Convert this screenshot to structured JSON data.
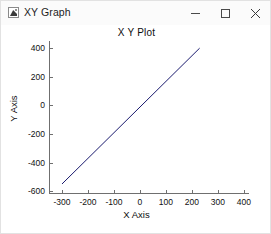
{
  "window": {
    "title": "XY Graph",
    "icon": "figure-app-icon",
    "controls": {
      "minimize_label": "−",
      "maximize_label": "□",
      "close_label": "×"
    }
  },
  "figure": {
    "title": "X Y Plot",
    "xlabel": "X Axis",
    "ylabel": "Y Axis"
  },
  "chart_data": {
    "type": "line",
    "title": "X Y Plot",
    "xlabel": "X Axis",
    "ylabel": "Y Axis",
    "grid": false,
    "legend": null,
    "line_color": "#1a1a6e",
    "background": "#ffffff",
    "xlim": [
      -350,
      420
    ],
    "ylim": [
      -620,
      450
    ],
    "xticks": [
      -300,
      -200,
      -100,
      0,
      100,
      200,
      300,
      400
    ],
    "xticklabels": [
      "-300",
      "-200",
      "-100",
      "0",
      "100",
      "200",
      "300",
      "400"
    ],
    "yticks": [
      -600,
      -400,
      -200,
      0,
      200,
      400
    ],
    "yticklabels": [
      "-600",
      "-400",
      "-200",
      "0",
      "200",
      "400"
    ],
    "series": [
      {
        "name": "y = x",
        "x": [
          -300,
          230
        ],
        "y": [
          -550,
          400
        ]
      }
    ]
  }
}
